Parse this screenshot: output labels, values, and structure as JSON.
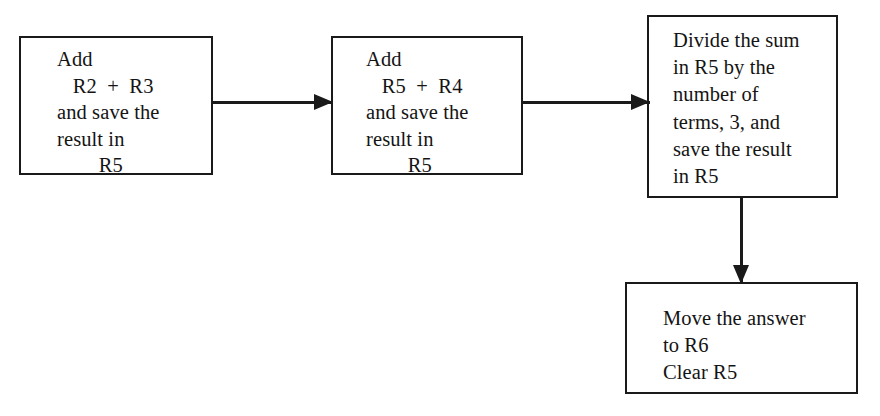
{
  "diagram": {
    "type": "flowchart",
    "title": "",
    "orientation": "left-to-right then down",
    "background_color": "#ffffff",
    "stroke_color": "#1a1a1a",
    "text_color": "#141414",
    "nodes": [
      {
        "id": "add-r2-r3",
        "shape": "rectangle",
        "text": "Add\n   R2  +  R3\nand save the\nresult in\n        R5",
        "text_align": "left"
      },
      {
        "id": "add-r5-r4",
        "shape": "rectangle",
        "text": "Add\n   R5  +  R4\nand save the\nresult in\n        R5",
        "text_align": "left"
      },
      {
        "id": "divide-sum",
        "shape": "rectangle",
        "text": "Divide the sum\nin R5 by the\nnumber of\nterms, 3, and\nsave the result\nin R5",
        "text_align": "left"
      },
      {
        "id": "move-answer",
        "shape": "rectangle",
        "text": "Move the answer\nto R6\nClear R5",
        "text_align": "left"
      }
    ],
    "edges": [
      {
        "id": "edge-1",
        "from": "add-r2-r3",
        "to": "add-r5-r4",
        "direction": "right",
        "label": ""
      },
      {
        "id": "edge-2",
        "from": "add-r5-r4",
        "to": "divide-sum",
        "direction": "right",
        "label": ""
      },
      {
        "id": "edge-3",
        "from": "divide-sum",
        "to": "move-answer",
        "direction": "down",
        "label": ""
      }
    ]
  }
}
